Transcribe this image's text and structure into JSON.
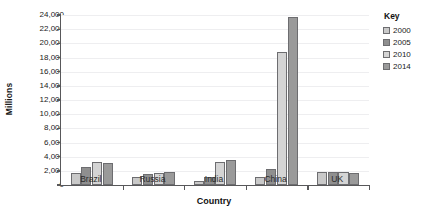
{
  "chart_data": {
    "type": "bar",
    "title": "",
    "xlabel": "Country",
    "ylabel": "Millions",
    "categories": [
      "Brazil",
      "Russia",
      "India",
      "China",
      "UK"
    ],
    "series": [
      {
        "name": "2000",
        "values": [
          1700,
          1200,
          500,
          1200,
          1800
        ],
        "color": "#c9c9c9"
      },
      {
        "name": "2005",
        "values": [
          2600,
          1500,
          1200,
          2300,
          1800
        ],
        "color": "#8f8f8f"
      },
      {
        "name": "2010",
        "values": [
          3300,
          1700,
          3300,
          18800,
          1900
        ],
        "color": "#d4d4d4"
      },
      {
        "name": "2014",
        "values": [
          3100,
          1900,
          3600,
          23700,
          1700
        ],
        "color": "#9a9a9a"
      }
    ],
    "ylim": [
      0,
      24000
    ],
    "yticks": [
      "0",
      "2,000",
      "4,000",
      "6,000",
      "8,000",
      "10,000",
      "12,000",
      "14,000",
      "16,000",
      "18,000",
      "20,000",
      "22,000",
      "24,000"
    ],
    "ytick_values": [
      0,
      2000,
      4000,
      6000,
      8000,
      10000,
      12000,
      14000,
      16000,
      18000,
      20000,
      22000,
      24000
    ],
    "grid": true,
    "legend_position": "right",
    "legend_title": "Key"
  },
  "legend": {
    "title": "Key",
    "items": [
      {
        "label": "2000"
      },
      {
        "label": "2005"
      },
      {
        "label": "2010"
      },
      {
        "label": "2014"
      }
    ]
  },
  "axes": {
    "x_title": "Country",
    "y_title": "Millions"
  },
  "title_clip": ""
}
